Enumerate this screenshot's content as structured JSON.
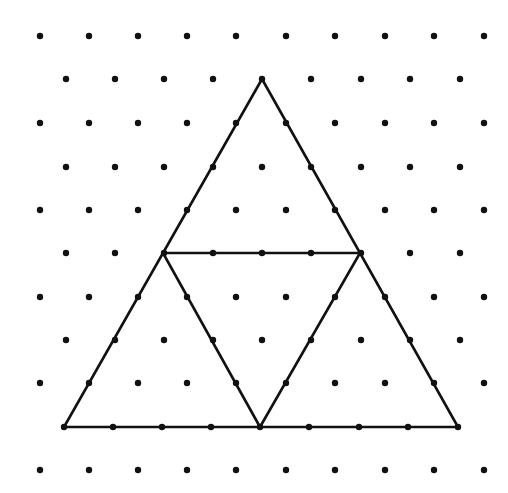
{
  "figure": {
    "background": "#ffffff",
    "ink": "#111111"
  },
  "grid": {
    "rows": [
      {
        "y": 36,
        "xs": [
          40,
          89,
          138,
          187,
          236,
          286,
          335,
          385,
          434,
          484
        ]
      },
      {
        "y": 79,
        "xs": [
          66,
          115,
          164,
          213,
          262,
          311,
          361,
          410,
          460
        ]
      },
      {
        "y": 123,
        "xs": [
          40,
          89,
          138,
          187,
          236,
          286,
          335,
          385,
          434,
          484
        ]
      },
      {
        "y": 167,
        "xs": [
          66,
          115,
          164,
          213,
          262,
          311,
          361,
          410,
          460
        ]
      },
      {
        "y": 210,
        "xs": [
          40,
          89,
          138,
          187,
          236,
          286,
          335,
          385,
          434,
          484
        ]
      },
      {
        "y": 253,
        "xs": [
          66,
          115,
          164,
          213,
          262,
          311,
          361,
          410,
          460
        ]
      },
      {
        "y": 297,
        "xs": [
          40,
          89,
          138,
          187,
          236,
          286,
          335,
          385,
          434,
          484
        ]
      },
      {
        "y": 340,
        "xs": [
          66,
          115,
          164,
          213,
          262,
          311,
          361,
          410,
          460
        ]
      },
      {
        "y": 383,
        "xs": [
          40,
          89,
          138,
          187,
          236,
          286,
          335,
          385,
          434,
          484
        ]
      },
      {
        "y": 427,
        "xs": [
          64,
          113,
          162,
          211,
          260,
          309,
          359,
          408,
          458
        ]
      },
      {
        "y": 470,
        "xs": [
          40,
          89,
          138,
          187,
          236,
          286,
          335,
          385,
          434,
          484
        ]
      }
    ],
    "dot_radius": 3.2
  },
  "shapes": {
    "outer_triangle": {
      "points": [
        [
          262,
          79
        ],
        [
          64,
          427
        ],
        [
          458,
          427
        ]
      ]
    },
    "inner_triangle": {
      "points": [
        [
          163,
          253
        ],
        [
          360,
          253
        ],
        [
          260,
          427
        ]
      ]
    },
    "stroke_width": 2.6
  }
}
